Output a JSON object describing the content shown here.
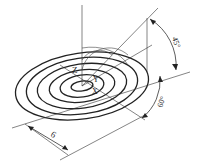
{
  "diagram": {
    "type": "isometric concentric ellipses with axes and dimensions",
    "labels": {
      "z_axis": "Z",
      "y_axis": "Y",
      "x_axis": "X",
      "angle_top": "45°",
      "angle_right": "60°",
      "dimension_bottom": "6"
    },
    "ellipse_count": 6,
    "colors": {
      "stroke": "#222222",
      "background": "#ffffff"
    }
  }
}
